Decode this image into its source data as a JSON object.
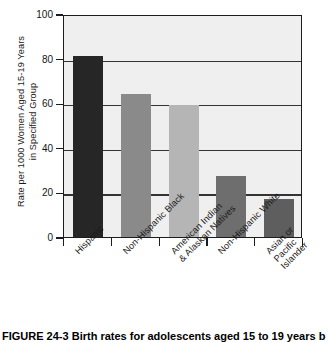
{
  "chart_data": {
    "type": "bar",
    "title": "",
    "xlabel": "",
    "ylabel": "Rate per 1000 Women Aged 15-19 Years\nin Specified Group",
    "ylim": [
      0,
      100
    ],
    "yticks": [
      0,
      20,
      40,
      60,
      80,
      100
    ],
    "ytick_labels": [
      "0",
      "20",
      "40",
      "60",
      "80",
      "100"
    ],
    "grid": true,
    "legend": "none",
    "categories": [
      "Hispanic",
      "Non-Hispanic Black",
      "American Indian\n& Alaskan Natives",
      "Non-Hispanic White",
      "Asian or Pacific Islander"
    ],
    "values": [
      81,
      64,
      59,
      27.5,
      17
    ],
    "bar_colors": [
      "#262626",
      "#8a8a8a",
      "#b5b5b5",
      "#6e6e6e",
      "#5e5e5e"
    ],
    "plot_background": "#efefef",
    "axis_color": "#1c1c1c"
  },
  "caption": {
    "text": "FIGURE 24-3  Birth rates for adolescents aged 15 to 19 years b"
  }
}
